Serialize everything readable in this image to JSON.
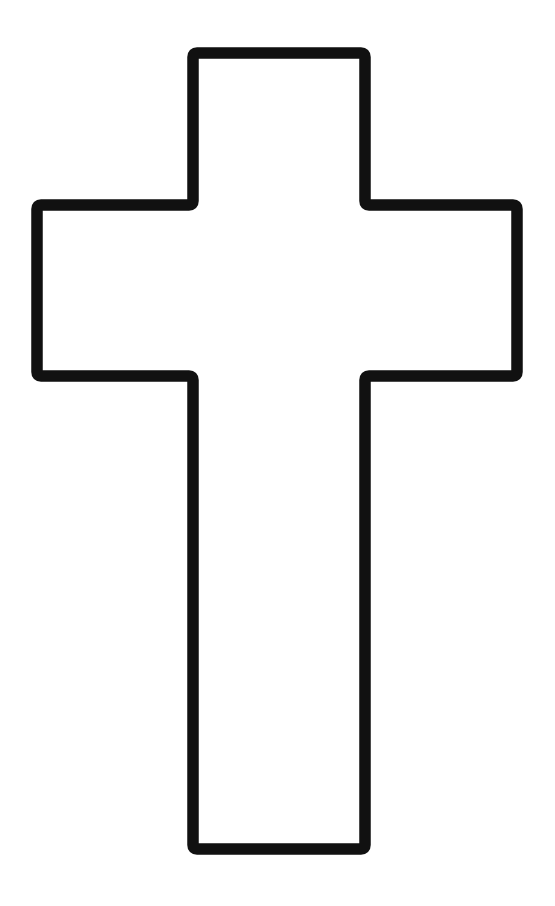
{
  "canvas": {
    "width": 555,
    "height": 906,
    "background_color": "#FFFFFF",
    "title": "Latin Cross Outline"
  },
  "figure": {
    "name": "latin-cross-outline",
    "description": "Black outline drawing of a Latin cross on a plain white background",
    "stroke_color": "#111111",
    "fill_color": "#FFFFFF",
    "stroke_width": 11.5,
    "stroke_linejoin": "round",
    "stroke_linecap": "round",
    "corner_radius": 4,
    "geometry": {
      "top_bar": {
        "left": 187,
        "right": 371,
        "top": 53
      },
      "arms": {
        "left": 31,
        "right": 523,
        "top": 205,
        "bottom": 382
      },
      "stem": {
        "left": 187,
        "right": 371,
        "bottom": 855
      }
    },
    "path_points": [
      [
        193,
        53
      ],
      [
        365,
        53
      ],
      [
        365,
        205
      ],
      [
        517,
        205
      ],
      [
        517,
        376
      ],
      [
        365,
        376
      ],
      [
        365,
        849
      ],
      [
        193,
        849
      ],
      [
        193,
        376
      ],
      [
        37,
        376
      ],
      [
        37,
        205
      ],
      [
        193,
        205
      ]
    ]
  },
  "chart_data": {
    "type": "line",
    "xlabel": "",
    "ylabel": "",
    "xlim": [
      0,
      555
    ],
    "ylim": [
      906,
      0
    ],
    "grid": false,
    "legend": "none",
    "series": [
      {
        "name": "cross-outline",
        "closed": true,
        "x": [
          193,
          365,
          365,
          517,
          517,
          365,
          365,
          193,
          193,
          37,
          37,
          193
        ],
        "y": [
          53,
          53,
          205,
          205,
          376,
          376,
          849,
          849,
          376,
          376,
          205,
          205
        ]
      }
    ]
  }
}
